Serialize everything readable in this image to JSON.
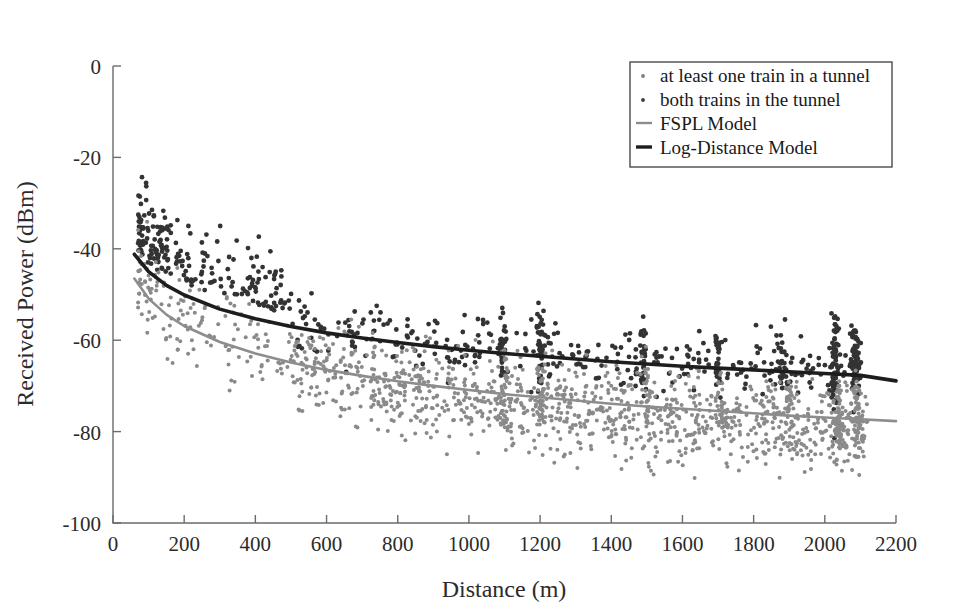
{
  "figure": {
    "background": "#ffffff",
    "width": 954,
    "height": 615
  },
  "chart_data": {
    "type": "scatter",
    "title": "",
    "xlabel": "Distance (m)",
    "ylabel": "Received Power (dBm)",
    "xlim": [
      0,
      2200
    ],
    "ylim": [
      -100,
      0
    ],
    "xticks": [
      0,
      200,
      400,
      600,
      800,
      1000,
      1200,
      1400,
      1600,
      1800,
      2000,
      2200
    ],
    "yticks": [
      0,
      -20,
      -40,
      -60,
      -80,
      -100
    ],
    "xticklabels": [
      "0",
      "200",
      "400",
      "600",
      "800",
      "1000",
      "1200",
      "1400",
      "1600",
      "1800",
      "2000",
      "2200"
    ],
    "yticklabels": [
      "0",
      "-20",
      "-40",
      "-60",
      "-80",
      "-100"
    ],
    "grid": false,
    "legend_position": "upper right",
    "legend_entries": [
      {
        "label": "at least one train in a tunnel",
        "marker": "dot",
        "color": "#7d7d7d"
      },
      {
        "label": "both trains in the tunnel",
        "marker": "dot",
        "color": "#3a3a3a"
      },
      {
        "label": "FSPL Model",
        "marker": "line",
        "color": "#8d8d8d"
      },
      {
        "label": "Log-Distance Model",
        "marker": "line",
        "color": "#1d1d1d"
      }
    ],
    "series": [
      {
        "name": "at least one train in a tunnel",
        "type": "scatter",
        "marker": "dot",
        "color": "#8a8a8a",
        "marker_size": 2.0,
        "point_count_approx": 1450,
        "x_range": [
          60,
          2120
        ],
        "y_range": [
          -97,
          -18
        ],
        "description": "light gray measurements spread widely below the models, dominant beyond 500 m"
      },
      {
        "name": "both trains in the tunnel",
        "type": "scatter",
        "marker": "dot",
        "color": "#333333",
        "marker_size": 2.4,
        "point_count_approx": 780,
        "x_range": [
          70,
          2120
        ],
        "y_range": [
          -92,
          -17
        ],
        "description": "dark measurements concentrated near and above the Log-Distance curve, with dense vertical clusters near 1100, 1200, 1500, 1700, 1900 and 2000-2100 m"
      },
      {
        "name": "FSPL Model",
        "type": "line",
        "color": "#8d8d8d",
        "x": [
          60,
          100,
          150,
          200,
          300,
          400,
          500,
          600,
          700,
          800,
          900,
          1000,
          1100,
          1200,
          1300,
          1400,
          1500,
          1600,
          1700,
          1800,
          1900,
          2000,
          2100,
          2200
        ],
        "y": [
          -46.5,
          -50.9,
          -54.4,
          -56.9,
          -60.4,
          -62.9,
          -64.9,
          -66.5,
          -67.8,
          -69.0,
          -70.0,
          -70.9,
          -71.8,
          -72.5,
          -73.2,
          -73.9,
          -74.5,
          -75.0,
          -75.5,
          -76.0,
          -76.5,
          -76.9,
          -77.3,
          -77.7
        ],
        "description": "free-space path loss reference curve"
      },
      {
        "name": "Log-Distance Model",
        "type": "line",
        "color": "#1d1d1d",
        "x": [
          60,
          100,
          150,
          200,
          300,
          400,
          500,
          600,
          700,
          800,
          900,
          1000,
          1100,
          1200,
          1300,
          1400,
          1500,
          1600,
          1700,
          1800,
          1900,
          2000,
          2100,
          2200
        ],
        "y": [
          -41.2,
          -45.0,
          -48.0,
          -50.1,
          -53.2,
          -55.3,
          -57.0,
          -58.4,
          -59.5,
          -60.5,
          -61.4,
          -62.2,
          -62.9,
          -63.5,
          -64.1,
          -64.7,
          -65.2,
          -65.7,
          -66.1,
          -66.5,
          -66.9,
          -67.3,
          -67.7,
          -68.9
        ],
        "description": "fitted log-distance path loss model, lies above FSPL across the full range"
      }
    ]
  }
}
